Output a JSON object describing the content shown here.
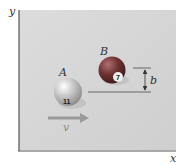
{
  "diagram": {
    "axes": {
      "y_label": "y",
      "x_label": "x"
    },
    "balls": [
      {
        "label": "A",
        "number": "11",
        "color": "#d8d8d8"
      },
      {
        "label": "B",
        "number": "7",
        "color": "#7a3a3a"
      }
    ],
    "dimension_label": "b",
    "velocity_label": "v",
    "colors": {
      "panel": "#d4d4d4",
      "axis": "#555555",
      "line": "#666666",
      "arrow": "#9a9a9a"
    }
  }
}
